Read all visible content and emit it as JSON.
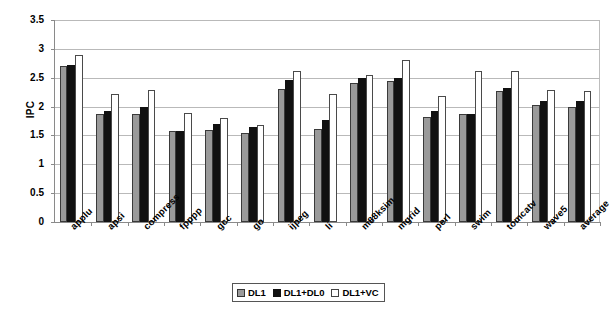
{
  "chart_data": {
    "type": "bar",
    "title": "",
    "xlabel": "",
    "ylabel": "IPC",
    "ylim": [
      0,
      3.5
    ],
    "ytick_step": 0.5,
    "yticks": [
      "0",
      "0.5",
      "1",
      "1.5",
      "2",
      "2.5",
      "3",
      "3.5"
    ],
    "grid": true,
    "legend_position": "bottom-center",
    "categories": [
      "applu",
      "apsi",
      "compress",
      "fpppp",
      "gcc",
      "go",
      "ijpeg",
      "li",
      "m88ksim",
      "mgrid",
      "perl",
      "swim",
      "tomcatv",
      "wave5",
      "average"
    ],
    "series": [
      {
        "name": "DL1",
        "color": "#9a9a9a",
        "values": [
          2.7,
          1.88,
          1.87,
          1.58,
          1.59,
          1.55,
          2.31,
          1.61,
          2.41,
          2.45,
          1.82,
          1.87,
          2.27,
          2.02,
          2.0
        ]
      },
      {
        "name": "DL1+DL0",
        "color": "#111111",
        "values": [
          2.72,
          1.93,
          2.0,
          1.58,
          1.7,
          1.65,
          2.46,
          1.76,
          2.5,
          2.5,
          1.92,
          1.88,
          2.33,
          2.09,
          2.09
        ]
      },
      {
        "name": "DL1+VC",
        "color": "#ffffff",
        "values": [
          2.89,
          2.21,
          2.29,
          1.89,
          1.81,
          1.68,
          2.61,
          2.22,
          2.55,
          2.8,
          2.18,
          2.61,
          2.62,
          2.28,
          2.27
        ]
      }
    ]
  },
  "legend": {
    "items": [
      {
        "label": "DL1"
      },
      {
        "label": "DL1+DL0"
      },
      {
        "label": "DL1+VC"
      }
    ]
  }
}
